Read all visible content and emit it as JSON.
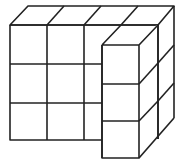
{
  "diagram": {
    "type": "isometric-block-structure",
    "stroke_color": "#222222",
    "background": "#ffffff",
    "front_grid": {
      "columns": 4,
      "rows": 3
    },
    "protruding_column": {
      "rows": 3
    }
  }
}
